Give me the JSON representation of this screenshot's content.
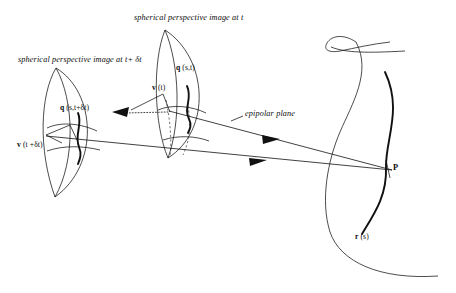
{
  "figure": {
    "background_color": "#ffffff",
    "ink_color": "#111111",
    "width": 456,
    "height": 293
  },
  "captions": {
    "image_at_t": "spherical perspective image at t",
    "image_at_t_plus_dt": "spherical perspective image at t+ δt"
  },
  "annotations": {
    "epipolar_plane": "epipolar plane"
  },
  "labels": {
    "q_at_t": {
      "symbol": "q",
      "args": "(s,t)"
    },
    "q_at_t_plus_dt": {
      "symbol": "q",
      "args": "(s,t+δt)"
    },
    "v_at_t": {
      "symbol": "v",
      "args": "(t)"
    },
    "v_at_t_plus_dt": {
      "symbol": "v",
      "args": "(t +δt)"
    },
    "surface_curve": {
      "symbol": "r",
      "args": "(s)"
    },
    "scene_point": "P"
  },
  "elements": {
    "sphere_t": "spherical-image-surface-at-t",
    "sphere_t_dt": "spherical-image-surface-at-t-plus-dt",
    "scene_surface": "scene-surface",
    "ray_upper": "ray-from-viewpoint-t-to-P",
    "ray_lower": "ray-from-viewpoint-t-plus-dt-to-P",
    "baseline": "dotted-baseline-between-viewpoints"
  }
}
